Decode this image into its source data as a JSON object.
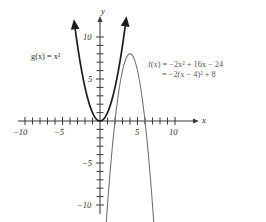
{
  "figure": {
    "axis_labels": {
      "x": "x",
      "y": "y"
    },
    "x_ticks": [
      {
        "value": -10,
        "label": "−10"
      },
      {
        "value": -5,
        "label": "−5"
      },
      {
        "value": 5,
        "label": "5"
      },
      {
        "value": 10,
        "label": "10"
      }
    ],
    "y_ticks": [
      {
        "value": 10,
        "label": "10"
      },
      {
        "value": 5,
        "label": "5"
      },
      {
        "value": -5,
        "label": "−5"
      },
      {
        "value": -10,
        "label": "−10"
      }
    ],
    "annotations": {
      "g_label_line1": "g(x) = x²",
      "f_label_line1": "f(x) = −2x² + 16x − 24",
      "f_label_line2": "= −2(x − 4)² + 8"
    },
    "colors": {
      "g_curve": "#1c1c1c",
      "f_curve": "#6e6e6e",
      "axis": "#3a3a3a",
      "text": "#2b2b2b",
      "f_text": "#585858",
      "background": "#ffffff"
    }
  },
  "chart_data": {
    "type": "line",
    "title": "",
    "xlabel": "x",
    "ylabel": "y",
    "xlim": [
      -11.5,
      13
    ],
    "ylim": [
      -12.5,
      12.5
    ],
    "grid": false,
    "legend": "inline-annotations",
    "x_tick_values": [
      -10,
      -5,
      5,
      10
    ],
    "y_tick_values": [
      10,
      5,
      -5,
      -10
    ],
    "minor_tick_interval": 1,
    "series": [
      {
        "name": "g(x) = x^2",
        "equation": "g(x) = x²",
        "color": "#1c1c1c",
        "vertex": [
          0,
          0
        ],
        "x": [
          -3.45,
          -3,
          -2.5,
          -2,
          -1.5,
          -1,
          -0.5,
          0,
          0.5,
          1,
          1.5,
          2,
          2.5,
          3,
          3.45
        ],
        "values": [
          11.9,
          9,
          6.25,
          4,
          2.25,
          1,
          0.25,
          0,
          0.25,
          1,
          2.25,
          4,
          6.25,
          9,
          11.9
        ]
      },
      {
        "name": "f(x) = -2x^2 + 16x - 24",
        "equation": "f(x) = −2x² + 16x − 24",
        "equation_vertex_form": "f(x) = −2(x − 4)² + 8",
        "color": "#6e6e6e",
        "vertex": [
          4,
          8
        ],
        "roots": [
          2,
          6
        ],
        "x": [
          0.8,
          1.5,
          2,
          2.5,
          3,
          3.5,
          4,
          4.5,
          5,
          5.5,
          6,
          6.5,
          7.2
        ],
        "values": [
          -11.3,
          -4.5,
          0,
          3.5,
          6,
          7.5,
          8,
          7.5,
          6,
          3.5,
          0,
          -4.5,
          -11.3
        ]
      }
    ]
  }
}
